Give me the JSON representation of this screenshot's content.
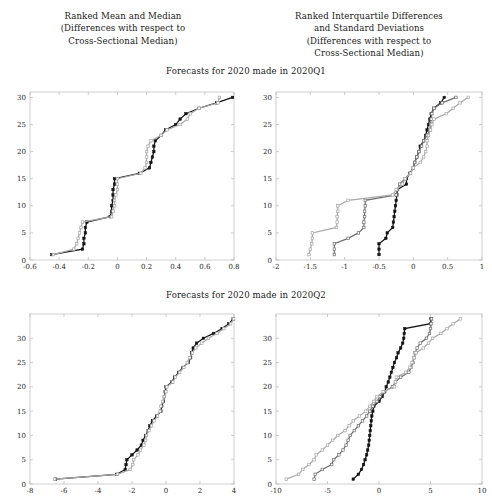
{
  "headings": {
    "left": {
      "lines": [
        "Ranked Mean and Median",
        "(Differences with respect to",
        "Cross-Sectional Median)"
      ]
    },
    "right": {
      "lines": [
        "Ranked Interquartile Differences",
        "and Standard Deviations",
        "(Differences with respect to",
        "Cross-Sectional Median)"
      ]
    }
  },
  "bands": {
    "q1": "Forecasts for 2020 made in 2020Q1",
    "q2": "Forecasts for 2020 made in 2020Q2"
  },
  "colors": {
    "black": "#141414",
    "dark_gray": "#707070",
    "light_gray": "#a9a9a9",
    "axis": "#b9b9b9"
  },
  "chart_data": [
    {
      "id": "top-left",
      "type": "line",
      "title": "Forecasts for 2020 made in 2020Q1",
      "column_heading": "Ranked Mean and Median (Differences with respect to Cross-Sectional Median)",
      "xlabel": "",
      "ylabel": "",
      "xlim": [
        -0.6,
        0.8
      ],
      "ylim": [
        0,
        31
      ],
      "xticks": [
        -0.6,
        -0.4,
        -0.2,
        0,
        0.2,
        0.4,
        0.6,
        0.8
      ],
      "xticklabels": [
        "-0.6",
        "-0.4",
        "-0.2",
        "0",
        "0.2",
        "0.4",
        "0.6",
        "0.8"
      ],
      "yticks": [
        0,
        5,
        10,
        15,
        20,
        25,
        30
      ],
      "yticklabels": [
        "0",
        "5",
        "10",
        "15",
        "20",
        "25",
        "30"
      ],
      "grid": false,
      "orientation": "rank-on-y",
      "series": [
        {
          "name": "Mean",
          "color": "#141414",
          "marker": "filled-square",
          "x": [
            -0.45,
            -0.24,
            -0.23,
            -0.23,
            -0.22,
            -0.22,
            -0.21,
            -0.05,
            -0.04,
            -0.04,
            -0.03,
            -0.03,
            -0.03,
            -0.02,
            -0.02,
            0.15,
            0.22,
            0.23,
            0.24,
            0.25,
            0.25,
            0.26,
            0.3,
            0.33,
            0.4,
            0.43,
            0.47,
            0.56,
            0.68,
            0.79
          ],
          "y": [
            1,
            2,
            3,
            4,
            5,
            6,
            7,
            8,
            9,
            10,
            11,
            12,
            13,
            14,
            15,
            16,
            17,
            18,
            19,
            20,
            21,
            22,
            23,
            24,
            25,
            26,
            27,
            28,
            29,
            30
          ]
        },
        {
          "name": "Median",
          "color": "#a9a9a9",
          "marker": "open-square",
          "x": [
            -0.44,
            -0.3,
            -0.28,
            -0.27,
            -0.26,
            -0.25,
            -0.24,
            -0.04,
            -0.03,
            -0.02,
            -0.02,
            -0.01,
            0.0,
            0.0,
            0.0,
            0.16,
            0.19,
            0.2,
            0.2,
            0.2,
            0.21,
            0.23,
            0.3,
            0.34,
            0.43,
            0.48,
            0.5,
            0.56,
            0.69,
            0.7
          ],
          "y": [
            1,
            2,
            3,
            4,
            5,
            6,
            7,
            8,
            9,
            10,
            11,
            12,
            13,
            14,
            15,
            16,
            17,
            18,
            19,
            20,
            21,
            22,
            23,
            24,
            25,
            26,
            27,
            28,
            29,
            30
          ]
        }
      ]
    },
    {
      "id": "top-right",
      "type": "line",
      "title": "Forecasts for 2020 made in 2020Q1",
      "column_heading": "Ranked Interquartile Differences and Standard Deviations (Differences with respect to Cross-Sectional Median)",
      "xlabel": "",
      "ylabel": "",
      "xlim": [
        -2,
        1
      ],
      "ylim": [
        0,
        31
      ],
      "xticks": [
        -2,
        -1.5,
        -1,
        -0.5,
        0,
        0.5,
        1
      ],
      "xticklabels": [
        "-2",
        "-1.5",
        "-1",
        "-0.5",
        "0",
        "0.5",
        "1"
      ],
      "yticks": [
        0,
        5,
        10,
        15,
        20,
        25,
        30
      ],
      "yticklabels": [
        "0",
        "5",
        "10",
        "15",
        "20",
        "25",
        "30"
      ],
      "grid": false,
      "orientation": "rank-on-y",
      "series": [
        {
          "name": "Series A",
          "color": "#141414",
          "marker": "filled-square",
          "x": [
            -0.5,
            -0.5,
            -0.5,
            -0.4,
            -0.38,
            -0.3,
            -0.29,
            -0.28,
            -0.27,
            -0.26,
            -0.25,
            -0.24,
            -0.23,
            -0.1,
            -0.1,
            -0.05,
            0.0,
            0.02,
            0.05,
            0.08,
            0.1,
            0.15,
            0.18,
            0.2,
            0.22,
            0.24,
            0.26,
            0.3,
            0.4,
            0.45
          ],
          "y": [
            1,
            2,
            3,
            4,
            5,
            6,
            7,
            8,
            9,
            10,
            11,
            12,
            13,
            14,
            15,
            16,
            17,
            18,
            19,
            20,
            21,
            22,
            23,
            24,
            25,
            26,
            27,
            28,
            29,
            30
          ]
        },
        {
          "name": "Series B",
          "color": "#707070",
          "marker": "open-square",
          "x": [
            -1.15,
            -1.15,
            -1.15,
            -0.95,
            -0.8,
            -0.72,
            -0.72,
            -0.71,
            -0.71,
            -0.7,
            -0.7,
            -0.25,
            -0.23,
            -0.2,
            -0.12,
            -0.05,
            0.0,
            0.02,
            0.05,
            0.08,
            0.12,
            0.15,
            0.2,
            0.24,
            0.25,
            0.26,
            0.27,
            0.3,
            0.42,
            0.62
          ],
          "y": [
            1,
            2,
            3,
            4,
            5,
            6,
            7,
            8,
            9,
            10,
            11,
            12,
            13,
            14,
            15,
            16,
            17,
            18,
            19,
            20,
            21,
            22,
            23,
            24,
            25,
            26,
            27,
            28,
            29,
            30
          ]
        },
        {
          "name": "Series C",
          "color": "#a9a9a9",
          "marker": "open-square",
          "x": [
            -1.52,
            -1.5,
            -1.48,
            -1.47,
            -1.47,
            -1.12,
            -1.11,
            -1.11,
            -1.1,
            -1.1,
            -0.95,
            -0.3,
            -0.25,
            -0.16,
            -0.12,
            -0.04,
            0.0,
            0.1,
            0.15,
            0.18,
            0.2,
            0.2,
            0.22,
            0.25,
            0.27,
            0.3,
            0.48,
            0.58,
            0.68,
            0.8
          ],
          "y": [
            1,
            2,
            3,
            4,
            5,
            6,
            7,
            8,
            9,
            10,
            11,
            12,
            13,
            14,
            15,
            16,
            17,
            18,
            19,
            20,
            21,
            22,
            23,
            24,
            25,
            26,
            27,
            28,
            29,
            30
          ]
        }
      ]
    },
    {
      "id": "bottom-left",
      "type": "line",
      "title": "Forecasts for 2020 made in 2020Q2",
      "column_heading": "Ranked Mean and Median (Differences with respect to Cross-Sectional Median)",
      "xlabel": "",
      "ylabel": "",
      "xlim": [
        -8,
        4
      ],
      "ylim": [
        0,
        35
      ],
      "xticks": [
        -8,
        -6,
        -4,
        -2,
        0,
        2,
        4
      ],
      "xticklabels": [
        "-8",
        "-6",
        "-4",
        "-2",
        "0",
        "2",
        "4"
      ],
      "yticks": [
        0,
        5,
        10,
        15,
        20,
        25,
        30
      ],
      "yticklabels": [
        "0",
        "5",
        "10",
        "15",
        "20",
        "25",
        "30"
      ],
      "grid": false,
      "orientation": "rank-on-y",
      "series": [
        {
          "name": "Mean",
          "color": "#141414",
          "marker": "filled-square",
          "x": [
            -6.5,
            -2.9,
            -2.4,
            -2.35,
            -2.3,
            -2.0,
            -1.7,
            -1.45,
            -1.35,
            -1.2,
            -1.05,
            -0.95,
            -0.8,
            -0.55,
            -0.3,
            -0.25,
            -0.15,
            -0.1,
            -0.05,
            0.0,
            0.35,
            0.5,
            0.75,
            1.0,
            1.3,
            1.45,
            1.5,
            1.6,
            1.8,
            2.2,
            2.8,
            3.3,
            3.7,
            3.95
          ],
          "y": [
            1,
            2,
            3,
            4,
            5,
            6,
            7,
            8,
            9,
            10,
            11,
            12,
            13,
            14,
            15,
            16,
            17,
            18,
            19,
            20,
            21,
            22,
            23,
            24,
            25,
            26,
            27,
            28,
            29,
            30,
            31,
            32,
            33,
            34
          ]
        },
        {
          "name": "Median",
          "color": "#a9a9a9",
          "marker": "open-square",
          "x": [
            -6.55,
            -2.85,
            -2.1,
            -1.95,
            -1.9,
            -1.65,
            -1.5,
            -1.3,
            -1.2,
            -1.15,
            -1.0,
            -0.85,
            -0.7,
            -0.5,
            -0.35,
            -0.3,
            -0.2,
            -0.1,
            0.0,
            0.05,
            0.4,
            0.55,
            0.8,
            1.05,
            1.25,
            1.4,
            1.55,
            1.75,
            2.1,
            2.5,
            3.0,
            3.4,
            3.8,
            3.98
          ],
          "y": [
            1,
            2,
            3,
            4,
            5,
            6,
            7,
            8,
            9,
            10,
            11,
            12,
            13,
            14,
            15,
            16,
            17,
            18,
            19,
            20,
            21,
            22,
            23,
            24,
            25,
            26,
            27,
            28,
            29,
            30,
            31,
            32,
            33,
            34
          ]
        }
      ]
    },
    {
      "id": "bottom-right",
      "type": "line",
      "title": "Forecasts for 2020 made in 2020Q2",
      "column_heading": "Ranked Interquartile Differences and Standard Deviations (Differences with respect to Cross-Sectional Median)",
      "xlabel": "",
      "ylabel": "",
      "xlim": [
        -10,
        10
      ],
      "ylim": [
        0,
        35
      ],
      "xticks": [
        -10,
        -5,
        0,
        5,
        10
      ],
      "xticklabels": [
        "-10",
        "-5",
        "0",
        "5",
        "10"
      ],
      "yticks": [
        0,
        5,
        10,
        15,
        20,
        25,
        30
      ],
      "yticklabels": [
        "0",
        "5",
        "10",
        "15",
        "20",
        "25",
        "30"
      ],
      "grid": false,
      "orientation": "rank-on-y",
      "series": [
        {
          "name": "Series A",
          "color": "#141414",
          "marker": "filled-square",
          "x": [
            -2.5,
            -2.0,
            -1.7,
            -1.5,
            -1.35,
            -1.2,
            -1.1,
            -1.0,
            -0.95,
            -0.9,
            -0.85,
            -0.8,
            -0.75,
            -0.7,
            -0.6,
            -0.5,
            0.0,
            0.3,
            0.55,
            0.7,
            0.9,
            1.05,
            1.2,
            1.35,
            1.5,
            1.7,
            1.85,
            2.1,
            2.3,
            2.4,
            2.45,
            2.5,
            5.0,
            5.05
          ],
          "y": [
            1,
            2,
            3,
            4,
            5,
            6,
            7,
            8,
            9,
            10,
            11,
            12,
            13,
            14,
            15,
            16,
            17,
            18,
            19,
            20,
            21,
            22,
            23,
            24,
            25,
            26,
            27,
            28,
            29,
            30,
            31,
            32,
            33,
            34
          ]
        },
        {
          "name": "Series B",
          "color": "#707070",
          "marker": "open-square",
          "x": [
            -6.3,
            -6.2,
            -5.5,
            -4.6,
            -4.4,
            -3.9,
            -3.5,
            -3.2,
            -3.0,
            -2.8,
            -2.4,
            -2.0,
            -1.6,
            -1.2,
            -0.9,
            -0.6,
            -0.2,
            0.1,
            0.5,
            1.3,
            1.6,
            2.1,
            2.9,
            3.1,
            3.3,
            3.4,
            3.5,
            3.7,
            4.0,
            4.6,
            4.9,
            5.0,
            5.05,
            5.1
          ],
          "y": [
            1,
            2,
            3,
            4,
            5,
            6,
            7,
            8,
            9,
            10,
            11,
            12,
            13,
            14,
            15,
            16,
            17,
            18,
            19,
            20,
            21,
            22,
            23,
            24,
            25,
            26,
            27,
            28,
            29,
            30,
            31,
            32,
            33,
            34
          ]
        },
        {
          "name": "Series C",
          "color": "#a9a9a9",
          "marker": "open-square",
          "x": [
            -9.0,
            -7.8,
            -7.4,
            -6.8,
            -6.3,
            -6.1,
            -5.5,
            -5.0,
            -4.5,
            -4.0,
            -3.3,
            -2.9,
            -2.5,
            -1.9,
            -1.3,
            -0.9,
            -0.5,
            -0.2,
            0.4,
            1.5,
            1.6,
            1.7,
            2.6,
            3.0,
            3.2,
            3.4,
            3.6,
            4.3,
            4.8,
            5.2,
            6.0,
            6.6,
            7.2,
            7.9
          ],
          "y": [
            1,
            2,
            3,
            4,
            5,
            6,
            7,
            8,
            9,
            10,
            11,
            12,
            13,
            14,
            15,
            16,
            17,
            18,
            19,
            20,
            21,
            22,
            23,
            24,
            25,
            26,
            27,
            28,
            29,
            30,
            31,
            32,
            33,
            34
          ]
        }
      ]
    }
  ]
}
